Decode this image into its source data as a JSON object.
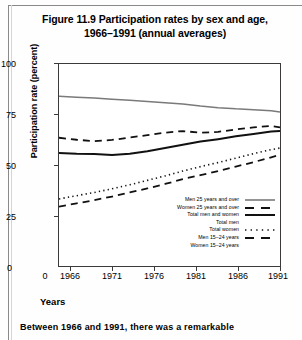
{
  "figure": {
    "title_line1": "Figure 11.9 Participation rates by sex and age,",
    "title_line2": "1966–1991 (annual averages)"
  },
  "axes": {
    "ylabel": "Participation rate (percent)",
    "xlabel": "Years",
    "yticks": [
      "100",
      "75",
      "50",
      "25",
      "0"
    ],
    "xticks": [
      "1966",
      "1971",
      "1976",
      "1981",
      "1986",
      "1991"
    ]
  },
  "legend": {
    "items": [
      {
        "label": "Men 25 years and over",
        "style": "solid-gray"
      },
      {
        "label": "Women 25 years and over",
        "style": "dashed-long"
      },
      {
        "label": "Total men and women",
        "style": "solid-black-bold"
      },
      {
        "label": "Total men",
        "style": "none"
      },
      {
        "label": "Total women",
        "style": "dotted"
      },
      {
        "label": "Men 15–24 years",
        "style": "dashed-long"
      },
      {
        "label": "Women 15–24 years",
        "style": "none"
      }
    ]
  },
  "body": {
    "paragraph_line1": "Between  1966  and  1991,  there  was  a  remarkable"
  },
  "colors": {
    "gray_line": "#7a7a7a",
    "black_line": "#111111",
    "frame": "#3a3a3a",
    "rule": "#8a8a8a",
    "page": "#fefefe"
  },
  "chart_data": {
    "type": "line",
    "title": "Figure 11.9 Participation rates by sex and age, 1966–1991 (annual averages)",
    "xlabel": "Years",
    "ylabel": "Participation rate (percent)",
    "xlim": [
      1966,
      1991
    ],
    "ylim": [
      0,
      100
    ],
    "yticks": [
      0,
      25,
      50,
      75,
      100
    ],
    "xticks": [
      1966,
      1971,
      1976,
      1981,
      1986,
      1991
    ],
    "grid": false,
    "legend_position": "inside-lower-right",
    "x": [
      1966,
      1968,
      1970,
      1972,
      1974,
      1976,
      1978,
      1980,
      1982,
      1984,
      1986,
      1988,
      1990,
      1991
    ],
    "series": [
      {
        "name": "Men 25 years and over",
        "style": "solid-gray",
        "values": [
          84.0,
          83.6,
          83.2,
          82.6,
          82.0,
          81.4,
          80.8,
          80.2,
          79.2,
          78.4,
          77.8,
          77.4,
          76.8,
          76.2
        ]
      },
      {
        "name": "Women 25 years and over",
        "style": "dashed-long",
        "values": [
          63.5,
          62.5,
          61.8,
          62.4,
          63.6,
          64.8,
          66.0,
          66.8,
          66.0,
          66.4,
          67.6,
          68.6,
          69.4,
          68.6
        ]
      },
      {
        "name": "Total men and women",
        "style": "solid-black-bold",
        "values": [
          56.0,
          55.6,
          55.4,
          55.0,
          55.6,
          56.8,
          58.4,
          60.0,
          61.6,
          62.8,
          64.2,
          65.4,
          66.6,
          66.8
        ]
      },
      {
        "name": "Total women",
        "style": "dotted",
        "values": [
          33.2,
          34.8,
          36.4,
          38.2,
          40.2,
          42.4,
          44.6,
          47.0,
          49.2,
          51.2,
          53.4,
          55.6,
          57.6,
          58.4
        ]
      },
      {
        "name": "Men 15–24 years",
        "style": "dashed-long",
        "values": [
          29.4,
          31.0,
          32.6,
          34.4,
          36.4,
          38.4,
          40.6,
          43.0,
          45.0,
          47.0,
          49.2,
          51.4,
          53.8,
          55.0
        ]
      }
    ]
  }
}
